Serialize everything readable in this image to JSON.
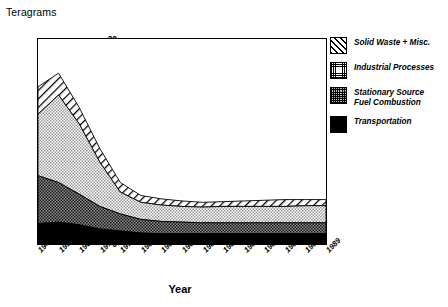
{
  "chart_data": {
    "type": "area",
    "stacked": true,
    "title": "",
    "xlabel": "Year",
    "ylabel": "Teragrams",
    "ylim": [
      0,
      30
    ],
    "yticks": [
      0,
      5,
      10,
      15,
      20,
      25,
      30
    ],
    "ytick_labels": [
      "0",
      "5",
      "10",
      "15",
      "20",
      "25",
      "30"
    ],
    "grid": false,
    "legend_position": "right",
    "categories": [
      "1940",
      "1950",
      "1960",
      "1970",
      "1975",
      "1980",
      "1981",
      "1982",
      "1983",
      "1984",
      "1985",
      "1986",
      "1987",
      "1988",
      "1989"
    ],
    "series": [
      {
        "name": "Transportation",
        "pattern": "solid-black",
        "color": "#000000",
        "values": [
          3.0,
          3.2,
          2.8,
          2.2,
          1.9,
          1.6,
          1.5,
          1.5,
          1.5,
          1.5,
          1.5,
          1.5,
          1.5,
          1.5,
          1.5
        ]
      },
      {
        "name": "Stationary Source Fuel Combustion",
        "pattern": "dark-checker",
        "color": "#6e6e6e",
        "values": [
          7.0,
          5.8,
          4.5,
          3.3,
          2.5,
          2.0,
          1.8,
          1.7,
          1.6,
          1.6,
          1.6,
          1.6,
          1.6,
          1.6,
          1.6
        ]
      },
      {
        "name": "Industrial Processes",
        "pattern": "light-checker",
        "color": "#c8c8c8",
        "values": [
          9.0,
          12.8,
          10.3,
          6.5,
          3.2,
          2.5,
          2.4,
          2.3,
          2.3,
          2.4,
          2.4,
          2.4,
          2.4,
          2.5,
          2.5
        ]
      },
      {
        "name": "Solid Waste + Misc.",
        "pattern": "diagonal-hatch",
        "color": "#ffffff",
        "values": [
          4.0,
          3.2,
          2.4,
          2.0,
          1.4,
          1.0,
          0.9,
          0.8,
          0.7,
          0.7,
          0.8,
          0.9,
          1.0,
          0.9,
          0.9
        ]
      }
    ],
    "totals": [
      23.0,
      25.0,
      20.0,
      14.0,
      9.0,
      7.1,
      6.6,
      6.3,
      6.1,
      6.2,
      6.3,
      6.4,
      6.5,
      6.5,
      6.5
    ],
    "annotations": []
  },
  "legend": {
    "items": [
      {
        "label": "Solid Waste + Misc.",
        "label2": "",
        "swatch": "diagonal-hatch-swatch"
      },
      {
        "label": "Industrial Processes",
        "label2": "",
        "swatch": "light-checker-swatch"
      },
      {
        "label": "Stationary Source",
        "label2": "Fuel Combustion",
        "swatch": "dark-checker-swatch"
      },
      {
        "label": "Transportation",
        "label2": "",
        "swatch": "solid-black-swatch"
      }
    ]
  }
}
